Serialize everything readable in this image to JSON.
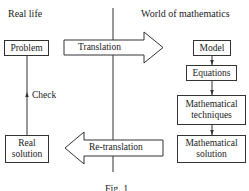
{
  "headings": {
    "left": "Real life",
    "right": "World of mathematics"
  },
  "real_life": {
    "problem": "Problem",
    "real_solution_line1": "Real",
    "real_solution_line2": "solution",
    "check_label": "Check"
  },
  "arrows": {
    "translation": "Translation",
    "retranslation": "Re-translation"
  },
  "math_world": {
    "model": "Model",
    "equations": "Equations",
    "techniques_line1": "Mathematical",
    "techniques_line2": "techniques",
    "solution_line1": "Mathematical",
    "solution_line2": "solution"
  },
  "caption": "Fig. 1",
  "colors": {
    "line": "#333333",
    "text": "#222222",
    "background": "#ffffff"
  }
}
